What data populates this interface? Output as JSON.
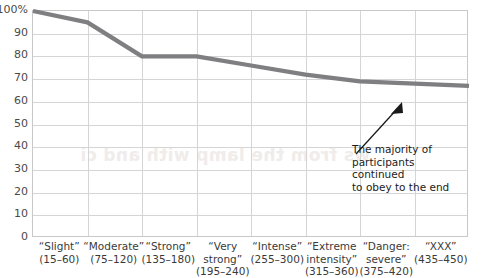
{
  "chart_data": {
    "type": "line",
    "title": "",
    "xlabel": "",
    "ylabel": "",
    "ylim": [
      0,
      100
    ],
    "ytick_labels": [
      "100%",
      "90",
      "80",
      "70",
      "60",
      "50",
      "40",
      "30",
      "20",
      "10",
      "0"
    ],
    "ytick_values": [
      100,
      90,
      80,
      70,
      60,
      50,
      40,
      30,
      20,
      10,
      0
    ],
    "grid": true,
    "legend": "none",
    "categories": [
      "“Slight” (15–60)",
      "“Moderate” (75–120)",
      "“Strong” (135–180)",
      "“Very strong” (195–240)",
      "“Intense” (255–300)",
      "“Extreme intensity” (315–360)",
      "“Danger: severe” (375–420)",
      "“XXX” (435–450)"
    ],
    "category_lines": [
      [
        "“Slight”",
        "(15–60)"
      ],
      [
        "“Moderate”",
        "(75–120)"
      ],
      [
        "“Strong”",
        "(135–180)"
      ],
      [
        "“Very",
        "strong”",
        "(195–240)"
      ],
      [
        "“Intense”",
        "(255–300)"
      ],
      [
        "“Extreme",
        "intensity”",
        "(315–360)"
      ],
      [
        "“Danger:",
        "severe”",
        "(375–420)"
      ],
      [
        "“XXX”",
        "(435–450)"
      ]
    ],
    "values": [
      100,
      95,
      80,
      80,
      76,
      72,
      69,
      67
    ],
    "line_color": "#7f7e81",
    "grid_color": "#d5d5d5",
    "axis_color": "#c9c9c9"
  },
  "annotation": {
    "text": "The majority of\nparticipants continued\nto obey to the end",
    "arrow": "up-right-arrow"
  },
  "bleed_artifact": {
    "text": "ws from the lamp with and ci"
  }
}
